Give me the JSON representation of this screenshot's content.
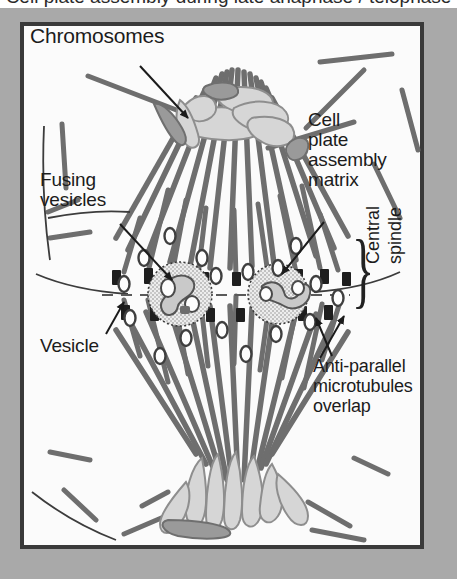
{
  "figure": {
    "title": "Cell plate assembly during late anaphase / telophase",
    "title_note": "top of title text is cropped off in the source image",
    "frame": {
      "margin_color": "#a9a9a9",
      "plate_background": "#fbfbfb",
      "border_color": "#3a3a3a"
    }
  },
  "labels": {
    "chromosomes": "Chromosomes",
    "cell_plate_assembly_matrix": "Cell\nplate\nassembly\nmatrix",
    "fusing_vesicles": "Fusing\nvesicles",
    "vesicle": "Vesicle",
    "anti_parallel": "Anti-parallel\nmicrotubules\noverlap",
    "central_spindle_line1": "Central",
    "central_spindle_line2": "spindle",
    "brace_glyph": "}"
  },
  "structures": {
    "microtubule": {
      "name": "microtubule",
      "color": "#6e6e6e",
      "count_visible": 58,
      "description": "grey rods forming two opposed cone-shaped half-spindles"
    },
    "chromosome_mass": {
      "name": "chromosome-mass",
      "fill": "#d4d4d4",
      "stroke": "#8c8c8c",
      "count": 2,
      "location": "top pole and bottom pole"
    },
    "vesicle": {
      "name": "vesicle",
      "fill": "#fdfdfd",
      "stroke": "#4a4a4a",
      "count_visible": 17,
      "description": "small open ellipses scattered through the midzone"
    },
    "cell_plate_assembly_matrix_body": {
      "name": "cell-plate-assembly-matrix",
      "fill": "#e8e8e8",
      "stroke": "#3a3a3a",
      "stipple": true,
      "count": 2,
      "description": "stippled circles at the midzone containing fusing dumbbell vesicles"
    },
    "fusing_vesicle_body": {
      "name": "fusing-vesicle",
      "fill": "#c9c9c9",
      "stroke": "#555555",
      "count": 2,
      "description": "dumbbell / tubulo-vesicular intermediates inside each matrix"
    },
    "midzone_overlap": {
      "name": "anti-parallel-overlap-zone",
      "marker_color": "#1e1e1e",
      "description": "short dark bars where opposing microtubule plus-ends interdigitate"
    },
    "division_plane": {
      "name": "division-plane-dashes",
      "color": "#555555",
      "description": "horizontal dashed line marking the forming cell plate"
    }
  },
  "leader_lines": {
    "color": "#1b1b1b",
    "items": [
      {
        "name": "leader-chromosomes",
        "from": "Chromosomes",
        "to": "upper chromosome mass",
        "arrow": true
      },
      {
        "name": "leader-cell-plate",
        "from": "Cell plate assembly matrix",
        "to": "right stippled matrix circle",
        "arrow": true
      },
      {
        "name": "leader-fusing",
        "from": "Fusing vesicles",
        "to": "left stippled matrix circle",
        "arrow": true
      },
      {
        "name": "leader-vesicle",
        "from": "Vesicle",
        "to": "open vesicle left of midzone",
        "arrow": true
      },
      {
        "name": "leader-antiparallel",
        "from": "Anti-parallel microtubules overlap",
        "to": "midzone overlap bars",
        "arrow": true
      }
    ]
  }
}
